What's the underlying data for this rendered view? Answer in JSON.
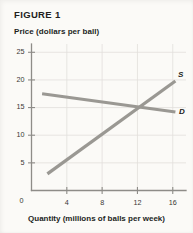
{
  "figure": {
    "title": "FIGURE 1"
  },
  "chart_data": {
    "type": "line",
    "title": "FIGURE 1",
    "xlabel": "Quantity (millions of balls per week)",
    "ylabel": "Price (dollars per ball)",
    "xlim": [
      0,
      17.5
    ],
    "ylim": [
      0,
      26.5
    ],
    "xticks": [
      0,
      4,
      8,
      12,
      16
    ],
    "yticks": [
      0,
      5,
      10,
      15,
      20,
      25
    ],
    "xtick_labels": [
      "0",
      "4",
      "8",
      "12",
      "16"
    ],
    "ytick_labels": [
      "0",
      "5",
      "10",
      "15",
      "20",
      "25"
    ],
    "grid": true,
    "legend": "inline-labels",
    "series": [
      {
        "name": "S",
        "label": "S",
        "description": "Supply curve, upward sloping",
        "color": "#9a9893",
        "points": [
          {
            "x": 1.8,
            "y": 3.0
          },
          {
            "x": 16.3,
            "y": 19.8
          }
        ],
        "label_position": {
          "x": 16.6,
          "y": 20.6
        }
      },
      {
        "name": "D",
        "label": "D",
        "description": "Demand curve, downward sloping",
        "color": "#9a9893",
        "points": [
          {
            "x": 1.2,
            "y": 17.5
          },
          {
            "x": 16.3,
            "y": 14.2
          }
        ],
        "label_position": {
          "x": 16.7,
          "y": 13.9
        }
      }
    ],
    "equilibrium": {
      "x": 12.0,
      "y": 15.0
    }
  }
}
